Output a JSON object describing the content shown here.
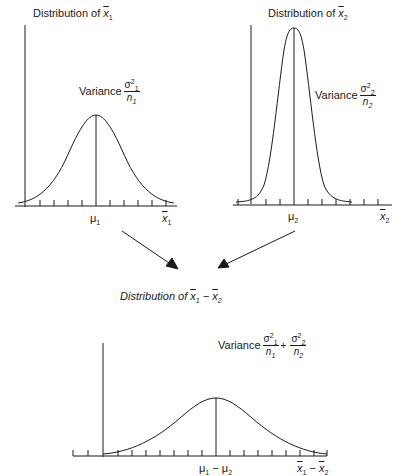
{
  "panels": {
    "top_left": {
      "title_prefix": "Distribution of ",
      "title_var": "x",
      "title_sub": "1",
      "variance_label": "Variance",
      "variance_num": "σ",
      "variance_num_sup": "2",
      "variance_num_sub": "1",
      "variance_den": "n",
      "variance_den_sub": "1",
      "mean_label": "μ",
      "mean_sub": "1",
      "axis_var": "x",
      "axis_sub": "1"
    },
    "top_right": {
      "title_prefix": "Distribution of ",
      "title_var": "x",
      "title_sub": "2",
      "variance_label": "Variance",
      "variance_num": "σ",
      "variance_num_sup": "2",
      "variance_num_sub": "2",
      "variance_den": "n",
      "variance_den_sub": "2",
      "mean_label": "μ",
      "mean_sub": "2",
      "axis_var": "x",
      "axis_sub": "2"
    },
    "bottom": {
      "title_prefix": "Distribution of ",
      "title_var1": "x",
      "title_sub1": "1",
      "title_minus": " − ",
      "title_var2": "x",
      "title_sub2": "2",
      "variance_label": "Variance",
      "term1_num": "σ",
      "term1_sup": "2",
      "term1_sub": "1",
      "term1_den": "n",
      "term1_den_sub": "1",
      "plus": "+",
      "term2_num": "σ",
      "term2_sup": "2",
      "term2_sub": "2",
      "term2_den": "n",
      "term2_den_sub": "2",
      "mean_mu1": "μ",
      "mean_sub1": "1",
      "mean_minus": " − ",
      "mean_mu2": "μ",
      "mean_sub2": "2",
      "axis_var1": "x",
      "axis_sub1": "1",
      "axis_minus": " − ",
      "axis_var2": "x",
      "axis_sub2": "2"
    }
  },
  "colors": {
    "line": "#1a1a1a",
    "background": "#ffffff"
  }
}
